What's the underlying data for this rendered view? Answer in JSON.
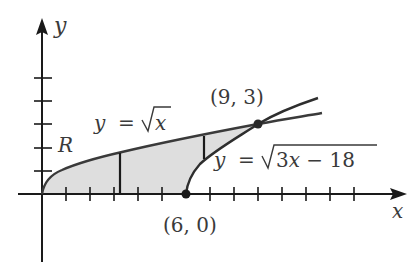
{
  "diagram": {
    "axes": {
      "x_label": "x",
      "y_label": "y"
    },
    "region_label": "R",
    "curves": [
      {
        "name": "sqrt_x",
        "label": "y = √x",
        "lhs": "y",
        "eq": "=",
        "rad": "x"
      },
      {
        "name": "sqrt_3x_minus_18",
        "label": "y = √3x − 18",
        "lhs": "y",
        "eq": "=",
        "rad": "3x − 18"
      }
    ],
    "points": [
      {
        "label": "(9, 3)",
        "x": 9,
        "y": 3
      },
      {
        "label": "(6, 0)",
        "x": 6,
        "y": 0
      }
    ],
    "colors": {
      "curve": "#3a3a3a",
      "fill": "#dcdcdc",
      "axis": "#1a1a1a",
      "text": "#3a3a3a"
    },
    "x_ticks": [
      1,
      2,
      3,
      4,
      5,
      6,
      7,
      8,
      9,
      10,
      11,
      12,
      13,
      14
    ],
    "y_ticks": [
      1,
      2,
      3,
      4,
      5
    ]
  }
}
